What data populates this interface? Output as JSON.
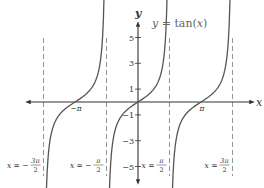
{
  "chart_data": {
    "type": "line",
    "title": "y = tan(x)",
    "function": "tan(x)",
    "xlabel": "x",
    "ylabel": "y",
    "ylim": [
      -5.5,
      5.5
    ],
    "xlim": [
      -6.8,
      6.5
    ],
    "y_ticks": [
      5,
      3,
      1,
      -1,
      -3,
      -5
    ],
    "y_tick_labels": [
      "5",
      "3",
      "1",
      "-1",
      "-3",
      "-5"
    ],
    "x_tick_labels": [
      "-π",
      "π"
    ],
    "x_ticks": [
      -3.14159,
      3.14159
    ],
    "asymptotes": [
      {
        "x": -4.712,
        "label": "x = −3π/2",
        "num": "3π",
        "sign": "−"
      },
      {
        "x": -1.571,
        "label": "x = −π/2",
        "num": "π",
        "sign": "−"
      },
      {
        "x": 1.571,
        "label": "x = π/2",
        "num": "π",
        "sign": ""
      },
      {
        "x": 4.712,
        "label": "x = 3π/2",
        "num": "3π",
        "sign": ""
      }
    ],
    "branches": [
      {
        "center": -3.14159,
        "range": [
          -4.6,
          -1.65
        ]
      },
      {
        "center": 0,
        "range": [
          -1.47,
          1.47
        ]
      },
      {
        "center": 3.14159,
        "range": [
          1.67,
          4.62
        ]
      }
    ],
    "grid": false,
    "legend": null
  },
  "labels": {
    "title_y": "y",
    "title_eq": " = tan(",
    "title_x": "x",
    "title_close": ")",
    "axis_x": "x",
    "axis_y": "y",
    "neg_pi": "−π",
    "pi": "π",
    "den": "2",
    "x_eq": "x = "
  }
}
